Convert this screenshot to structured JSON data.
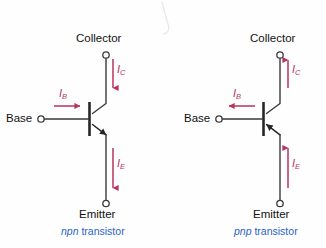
{
  "figure": {
    "colors": {
      "wire": "#3a3a3a",
      "current_arrow": "#b5355c",
      "caption": "#2a62c9",
      "label_text": "#111111",
      "background": "#ffffff"
    }
  },
  "diagrams": [
    {
      "id": "npn",
      "caption_emphasis": "npn",
      "caption_rest": " transistor",
      "terminals": {
        "collector": "Collector",
        "base": "Base",
        "emitter": "Emitter"
      },
      "currents": [
        {
          "name": "IC",
          "symbol": "I",
          "subscript": "C",
          "direction": "down",
          "meaning": "collector-current-into-device"
        },
        {
          "name": "IB",
          "symbol": "I",
          "subscript": "B",
          "direction": "right",
          "meaning": "base-current-into-device"
        },
        {
          "name": "IE",
          "symbol": "I",
          "subscript": "E",
          "direction": "down",
          "meaning": "emitter-current-out-of-device"
        }
      ],
      "emitter_arrow_direction": "outward"
    },
    {
      "id": "pnp",
      "caption_emphasis": "pnp",
      "caption_rest": " transistor",
      "terminals": {
        "collector": "Collector",
        "base": "Base",
        "emitter": "Emitter"
      },
      "currents": [
        {
          "name": "IC",
          "symbol": "I",
          "subscript": "C",
          "direction": "up",
          "meaning": "collector-current-out-of-device"
        },
        {
          "name": "IB",
          "symbol": "I",
          "subscript": "B",
          "direction": "left",
          "meaning": "base-current-out-of-device"
        },
        {
          "name": "IE",
          "symbol": "I",
          "subscript": "E",
          "direction": "up",
          "meaning": "emitter-current-into-device"
        }
      ],
      "emitter_arrow_direction": "inward"
    }
  ]
}
